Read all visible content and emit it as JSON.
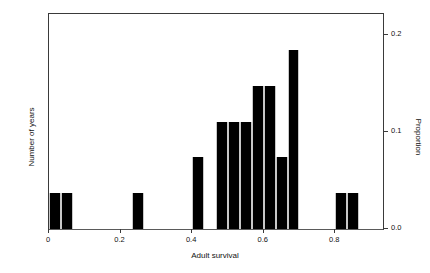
{
  "chart_data": {
    "type": "bar",
    "title": "",
    "subtitle": "",
    "xlabel": "Adult survival",
    "ylabel": "Number of years",
    "y2label": "Proportion",
    "xlim": [
      0.0,
      0.9333
    ],
    "ylim": [
      0,
      6
    ],
    "y2lim": [
      0.0,
      0.2222
    ],
    "grid": false,
    "legend": null,
    "bin_width": 0.03333,
    "xtick_labels": [
      "0",
      "0.2",
      "0.4",
      "0.6",
      "0.8"
    ],
    "xtick_values": [
      0,
      0.2,
      0.4,
      0.6,
      0.8
    ],
    "ytick_labels_left": [
      "0",
      "1",
      "2",
      "3",
      "4",
      "5",
      "6"
    ],
    "ytick_values_left": [
      0,
      1,
      2,
      3,
      4,
      5,
      6
    ],
    "ytick_labels_right": [
      "0.0",
      "0.1",
      "0.2"
    ],
    "ytick_values_right": [
      0.0,
      0.1,
      0.2
    ],
    "bins": [
      {
        "x0": 0.0,
        "x1": 0.0333,
        "count": 1,
        "proportion": 0.037
      },
      {
        "x0": 0.0333,
        "x1": 0.0667,
        "count": 1,
        "proportion": 0.037
      },
      {
        "x0": 0.0667,
        "x1": 0.1,
        "count": 0,
        "proportion": 0.0
      },
      {
        "x0": 0.1,
        "x1": 0.1333,
        "count": 0,
        "proportion": 0.0
      },
      {
        "x0": 0.1333,
        "x1": 0.1667,
        "count": 0,
        "proportion": 0.0
      },
      {
        "x0": 0.1667,
        "x1": 0.2,
        "count": 0,
        "proportion": 0.0
      },
      {
        "x0": 0.2,
        "x1": 0.2333,
        "count": 0,
        "proportion": 0.0
      },
      {
        "x0": 0.2333,
        "x1": 0.2667,
        "count": 1,
        "proportion": 0.037
      },
      {
        "x0": 0.2667,
        "x1": 0.3,
        "count": 0,
        "proportion": 0.0
      },
      {
        "x0": 0.3,
        "x1": 0.3333,
        "count": 0,
        "proportion": 0.0
      },
      {
        "x0": 0.3333,
        "x1": 0.3667,
        "count": 0,
        "proportion": 0.0
      },
      {
        "x0": 0.3667,
        "x1": 0.4,
        "count": 0,
        "proportion": 0.0
      },
      {
        "x0": 0.4,
        "x1": 0.4333,
        "count": 2,
        "proportion": 0.074
      },
      {
        "x0": 0.4333,
        "x1": 0.4667,
        "count": 0,
        "proportion": 0.0
      },
      {
        "x0": 0.4667,
        "x1": 0.5,
        "count": 3,
        "proportion": 0.111
      },
      {
        "x0": 0.5,
        "x1": 0.5333,
        "count": 3,
        "proportion": 0.111
      },
      {
        "x0": 0.5333,
        "x1": 0.5667,
        "count": 3,
        "proportion": 0.111
      },
      {
        "x0": 0.5667,
        "x1": 0.6,
        "count": 4,
        "proportion": 0.148
      },
      {
        "x0": 0.6,
        "x1": 0.6333,
        "count": 4,
        "proportion": 0.148
      },
      {
        "x0": 0.6333,
        "x1": 0.6667,
        "count": 2,
        "proportion": 0.074
      },
      {
        "x0": 0.6667,
        "x1": 0.7,
        "count": 5,
        "proportion": 0.185
      },
      {
        "x0": 0.7,
        "x1": 0.7333,
        "count": 0,
        "proportion": 0.0
      },
      {
        "x0": 0.7333,
        "x1": 0.7667,
        "count": 0,
        "proportion": 0.0
      },
      {
        "x0": 0.7667,
        "x1": 0.8,
        "count": 0,
        "proportion": 0.0
      },
      {
        "x0": 0.8,
        "x1": 0.8333,
        "count": 1,
        "proportion": 0.037
      },
      {
        "x0": 0.8333,
        "x1": 0.8667,
        "count": 1,
        "proportion": 0.037
      },
      {
        "x0": 0.8667,
        "x1": 0.9,
        "count": 0,
        "proportion": 0.0
      }
    ],
    "categories": [
      "0.017",
      "0.050",
      "0.083",
      "0.117",
      "0.150",
      "0.183",
      "0.217",
      "0.250",
      "0.283",
      "0.317",
      "0.350",
      "0.383",
      "0.417",
      "0.450",
      "0.483",
      "0.517",
      "0.550",
      "0.583",
      "0.617",
      "0.650",
      "0.683",
      "0.717",
      "0.750",
      "0.783",
      "0.817",
      "0.850",
      "0.883"
    ],
    "values": [
      1,
      1,
      0,
      0,
      0,
      0,
      0,
      1,
      0,
      0,
      0,
      0,
      2,
      0,
      3,
      3,
      3,
      4,
      4,
      2,
      5,
      0,
      0,
      0,
      1,
      1,
      0
    ],
    "colors": {
      "bar_fill": "#000000",
      "bar_edge": "#c8c8c8",
      "axis": "#3a3a3a",
      "text": "#111111",
      "background": "#ffffff"
    }
  }
}
